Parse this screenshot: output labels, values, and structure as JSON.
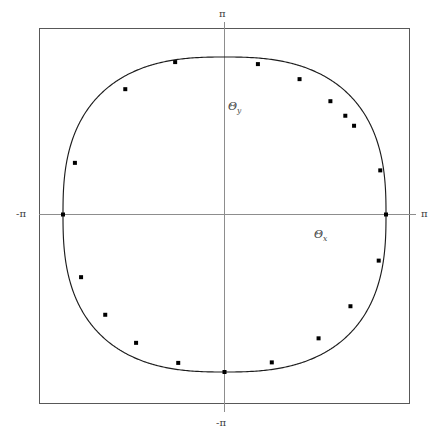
{
  "figure": {
    "title": "",
    "background_color": "#ffffff",
    "frame_color": "#555555",
    "axis_color": "#888888",
    "curve_color": "#1a1a1a",
    "marker_color": "#000000",
    "width": 439,
    "height": 439
  },
  "labels": {
    "pi_top": "π",
    "pi_bottom": "-π",
    "pi_left": "-π",
    "pi_right": "π",
    "theta_y": "Θ",
    "theta_y_sub": "y",
    "theta_x": "Θ",
    "theta_x_sub": "x"
  },
  "chart_data": {
    "type": "line",
    "title": "",
    "xlabel": "Θx",
    "ylabel": "Θy",
    "xlim": [
      -3.7699,
      3.7699
    ],
    "ylim": [
      -3.7699,
      3.7699
    ],
    "xticks": [
      -3.14159,
      3.14159
    ],
    "xticklabels": [
      "-π",
      "π"
    ],
    "yticks": [
      -3.14159,
      3.14159
    ],
    "yticklabels": [
      "-π",
      "π"
    ],
    "grid": false,
    "legend": null,
    "axes_drawn": [
      "x-axis-through-origin",
      "y-axis-through-origin"
    ],
    "frame": "rectangular-box",
    "series": [
      {
        "name": "closed-contour",
        "description": "Closed superellipse-like contour passing through (±π, 0) and (0, ±π)",
        "curve_exponent": 2.6,
        "radius": 3.14159,
        "closed": true
      },
      {
        "name": "sample-markers",
        "marker": "square",
        "marker_size": 4,
        "points": [
          [
            -3.14159,
            0.0
          ],
          [
            -2.91,
            1.03
          ],
          [
            -1.93,
            2.5
          ],
          [
            -0.96,
            3.04
          ],
          [
            0.65,
            3.0
          ],
          [
            1.46,
            2.7
          ],
          [
            2.06,
            2.26
          ],
          [
            2.35,
            1.97
          ],
          [
            2.52,
            1.77
          ],
          [
            3.03,
            0.88
          ],
          [
            3.14159,
            0.0
          ],
          [
            3.0,
            -0.92
          ],
          [
            2.45,
            -1.83
          ],
          [
            1.83,
            -2.47
          ],
          [
            0.92,
            -2.95
          ],
          [
            0.0,
            -3.14159
          ],
          [
            -0.9,
            -2.96
          ],
          [
            -1.72,
            -2.56
          ],
          [
            -2.32,
            -2.0
          ],
          [
            -2.79,
            -1.25
          ]
        ]
      }
    ]
  }
}
